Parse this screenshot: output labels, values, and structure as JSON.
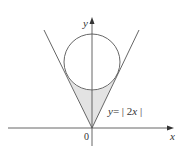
{
  "figure": {
    "axis_labels": {
      "x": "x",
      "y": "y",
      "origin": "0"
    },
    "curve_label": {
      "y": "y",
      "eq": "= | 2",
      "x": "x",
      "close": " |"
    },
    "elements": [
      "x-axis",
      "y-axis",
      "line y=|2x|",
      "circle tangent to lines",
      "shaded region between lines and circle"
    ],
    "colors": {
      "stroke": "#555555",
      "shade": "#e3e3e3",
      "text": "#333333"
    }
  }
}
